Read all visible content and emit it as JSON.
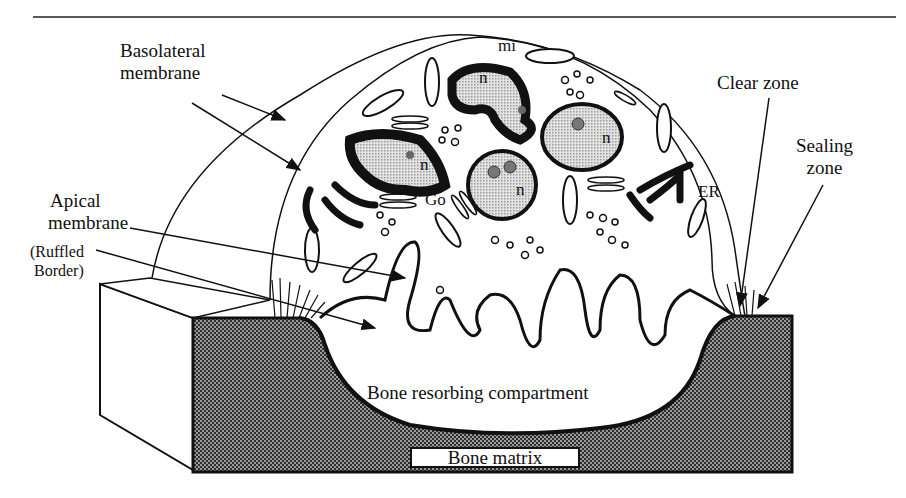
{
  "figure": {
    "labels": {
      "basolateral": [
        "Basolateral",
        "membrane"
      ],
      "apical": [
        "Apical",
        "membrane"
      ],
      "ruffled": [
        "(Ruffled",
        "Border)"
      ],
      "clear_zone": "Clear zone",
      "sealing": [
        "Sealing",
        "zone"
      ],
      "compartment": "Bone resorbing compartment",
      "bone_matrix": "Bone matrix"
    },
    "organelles": {
      "mitochondria": "mi",
      "nucleus": "n",
      "golgi": "Go",
      "er": "ER"
    },
    "colors": {
      "ink": "#111111",
      "nucleus_fill": "#c8c8c8",
      "bone_fill": "#3a3a3a",
      "background": "#ffffff"
    }
  }
}
